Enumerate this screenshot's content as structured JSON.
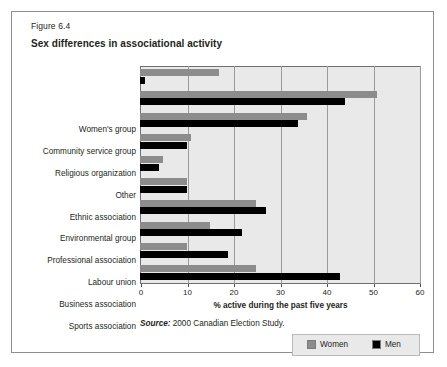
{
  "figure": {
    "number": "Figure 6.4",
    "title": "Sex differences in associational activity",
    "source_word": "Source:",
    "source_text": " 2000 Canadian Election Study."
  },
  "colors": {
    "women": "#8c8c8c",
    "men": "#000000",
    "plot_background": "#e9e9e9",
    "gridline": "#9a9a9a",
    "frame_border": "#8d8d8d",
    "text": "#231f20"
  },
  "legend": {
    "position": "bottom-right",
    "entries": [
      {
        "label": "Women",
        "color": "#8c8c8c"
      },
      {
        "label": "Men",
        "color": "#000000"
      }
    ]
  },
  "chart_data": {
    "type": "bar",
    "orientation": "horizontal",
    "title": "Sex differences in associational activity",
    "subtitle": "Figure 6.4",
    "xlabel": "% active during the past five years",
    "ylabel": "",
    "xlim": [
      0,
      60
    ],
    "xticks": [
      0,
      10,
      20,
      30,
      40,
      50,
      60
    ],
    "xtick_labels": [
      "0",
      "10",
      "20",
      "30",
      "40",
      "50",
      "60"
    ],
    "grid": true,
    "grid_axis": "x",
    "categories": [
      "Women's group",
      "Community service group",
      "Religious organization",
      "Other",
      "Ethnic association",
      "Environmental group",
      "Professional association",
      "Labour union",
      "Business association",
      "Sports association"
    ],
    "series": [
      {
        "name": "Women",
        "color": "#8c8c8c",
        "values": [
          17,
          51,
          36,
          11,
          5,
          10,
          25,
          15,
          10,
          25
        ]
      },
      {
        "name": "Men",
        "color": "#000000",
        "values": [
          1,
          44,
          34,
          10,
          4,
          10,
          27,
          22,
          19,
          43
        ]
      }
    ],
    "source": "Source: 2000 Canadian Election Study."
  }
}
